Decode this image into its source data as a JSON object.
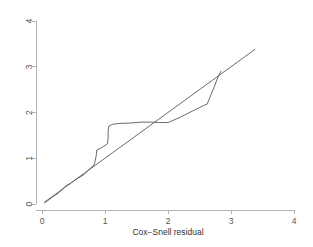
{
  "chart_data": {
    "type": "line",
    "title": "",
    "xlabel": "Cox−Snell residual",
    "ylabel": "",
    "xlim": [
      0,
      4
    ],
    "ylim": [
      0,
      4
    ],
    "xticks": [
      0,
      1,
      2,
      3,
      4
    ],
    "yticks": [
      0,
      1,
      2,
      3,
      4
    ],
    "xtick_labels": [
      "0",
      "1",
      "2",
      "3",
      "4"
    ],
    "ytick_labels": [
      "0",
      "1",
      "2",
      "3",
      "4"
    ],
    "grid": false,
    "legend": "none",
    "series": [
      {
        "name": "Nelson−Aalen cumulative hazard",
        "step": true,
        "points": [
          [
            0.04,
            0.03
          ],
          [
            0.1,
            0.08
          ],
          [
            0.16,
            0.15
          ],
          [
            0.22,
            0.2
          ],
          [
            0.28,
            0.26
          ],
          [
            0.33,
            0.33
          ],
          [
            0.38,
            0.4
          ],
          [
            0.44,
            0.44
          ],
          [
            0.5,
            0.5
          ],
          [
            0.56,
            0.56
          ],
          [
            0.62,
            0.6
          ],
          [
            0.68,
            0.66
          ],
          [
            0.73,
            0.73
          ],
          [
            0.78,
            0.8
          ],
          [
            0.82,
            0.83
          ],
          [
            0.84,
            0.92
          ],
          [
            0.86,
            1.05
          ],
          [
            0.87,
            1.18
          ],
          [
            0.93,
            1.22
          ],
          [
            1.0,
            1.28
          ],
          [
            1.04,
            1.32
          ],
          [
            1.05,
            1.45
          ],
          [
            1.05,
            1.6
          ],
          [
            1.06,
            1.7
          ],
          [
            1.12,
            1.74
          ],
          [
            1.22,
            1.76
          ],
          [
            1.4,
            1.77
          ],
          [
            1.58,
            1.79
          ],
          [
            1.72,
            1.79
          ],
          [
            1.86,
            1.78
          ],
          [
            2.0,
            1.78
          ],
          [
            2.2,
            1.9
          ],
          [
            2.4,
            2.04
          ],
          [
            2.58,
            2.16
          ],
          [
            2.62,
            2.18
          ],
          [
            2.68,
            2.38
          ],
          [
            2.74,
            2.58
          ],
          [
            2.8,
            2.8
          ],
          [
            2.84,
            2.9
          ]
        ]
      },
      {
        "name": "reference line",
        "step": false,
        "points": [
          [
            0.04,
            0.04
          ],
          [
            3.38,
            3.38
          ]
        ]
      }
    ],
    "colors": {
      "line": "#58595b",
      "axis": "#b4b4b4",
      "background": "#ffffff",
      "text": "#555555"
    },
    "axis_geometry": {
      "x0_px": 42,
      "x4_px": 294,
      "y0_px": 204,
      "y4_px": 21
    }
  }
}
